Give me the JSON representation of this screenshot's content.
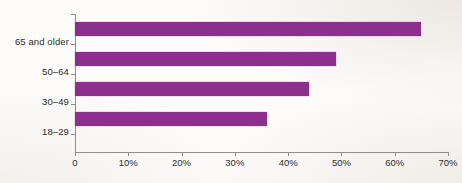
{
  "chart_data": {
    "type": "bar",
    "orientation": "horizontal",
    "title": "",
    "subtitle": "",
    "xlabel": "",
    "ylabel": "",
    "categories": [
      "18–29",
      "30–49",
      "50–64",
      "65 and older"
    ],
    "values": [
      36,
      44,
      49,
      65
    ],
    "value_unit": "%",
    "xlim": [
      0,
      70
    ],
    "x_ticks": [
      0,
      10,
      20,
      30,
      40,
      50,
      60,
      70
    ],
    "x_tick_labels": [
      "0",
      "10%",
      "20%",
      "30%",
      "40%",
      "50%",
      "60%",
      "70%"
    ],
    "grid": false,
    "legend": false,
    "legend_position": "none",
    "bar_color": "#8d2f8d",
    "axis_color": "#8e8e8e",
    "text_color": "#2b2b2b",
    "background_color": "#fdfcfb",
    "series": [
      {
        "name": "Share",
        "values": [
          36,
          44,
          49,
          65
        ]
      }
    ],
    "bars": [
      {
        "category": "65 and older",
        "value": 65,
        "label": "65 and older"
      },
      {
        "category": "50–64",
        "value": 49,
        "label": "50–64"
      },
      {
        "category": "30–49",
        "value": 44,
        "label": "30–49"
      },
      {
        "category": "18–29",
        "value": 36,
        "label": "18–29"
      }
    ]
  }
}
